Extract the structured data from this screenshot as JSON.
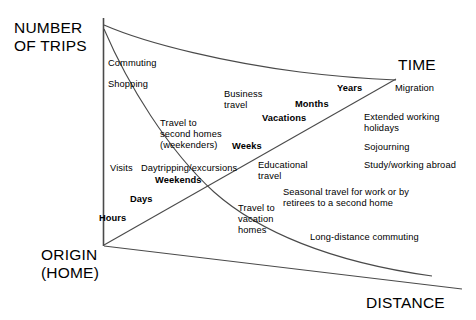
{
  "diagram": {
    "title_hidden": "",
    "axes": {
      "y_title": "NUMBER\nOF TRIPS",
      "x_title": "DISTANCE",
      "diagonal_title": "TIME",
      "origin_title": "ORIGIN\n(HOME)"
    },
    "time_scale_labels": [
      {
        "text": "Hours"
      },
      {
        "text": "Days"
      },
      {
        "text": "Weekends"
      },
      {
        "text": "Weeks"
      },
      {
        "text": "Vacations"
      },
      {
        "text": "Months"
      },
      {
        "text": "Years"
      }
    ],
    "trip_categories": [
      {
        "text": "Commuting"
      },
      {
        "text": "Shopping"
      },
      {
        "text": "Business\ntravel"
      },
      {
        "text": "Travel to\nsecond homes\n(weekenders)"
      },
      {
        "text": "Visits"
      },
      {
        "text": "Daytripping/excursions"
      },
      {
        "text": "Educational\ntravel"
      },
      {
        "text": "Travel to\nvacation\nhomes"
      },
      {
        "text": "Migration"
      },
      {
        "text": "Extended working\nholidays"
      },
      {
        "text": "Sojourning"
      },
      {
        "text": "Study/working abroad"
      },
      {
        "text": "Seasonal travel for work or by\nretirees to a second home"
      },
      {
        "text": "Long-distance commuting"
      }
    ],
    "colors": {
      "line": "#3f3f3f",
      "text": "#000000",
      "background": "#ffffff"
    }
  }
}
